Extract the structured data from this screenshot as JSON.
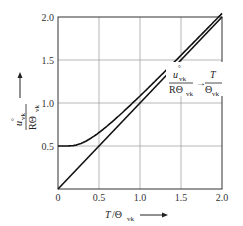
{
  "chart_data": {
    "type": "line",
    "title": "",
    "xlabel": "T/Θvk",
    "ylabel": "u°vk / RΘvk",
    "xlim": [
      0,
      2.0
    ],
    "ylim": [
      0,
      2.0
    ],
    "grid": true,
    "x_ticks": [
      "0",
      "0.5",
      "1.0",
      "1.5",
      "2.0"
    ],
    "y_ticks": [
      "0.5",
      "1.0",
      "1.5",
      "2.0"
    ],
    "series": [
      {
        "name": "u°vk / RΘvk",
        "x": [
          0,
          0.1,
          0.2,
          0.3,
          0.4,
          0.5,
          0.75,
          1.0,
          1.25,
          1.5,
          1.75,
          2.0
        ],
        "y": [
          0.5,
          0.5,
          0.503,
          0.518,
          0.552,
          0.602,
          0.776,
          1.041,
          1.266,
          1.514,
          1.762,
          2.011
        ]
      },
      {
        "name": "T/Θvk (asymptote)",
        "x": [
          0,
          2.0
        ],
        "y": [
          0,
          2.0
        ]
      }
    ],
    "annotation": {
      "numerator": "u°vk",
      "denominator": "RΘvk",
      "arrow": "→",
      "rhs_numerator": "T",
      "rhs_denominator": "Θvk"
    }
  }
}
